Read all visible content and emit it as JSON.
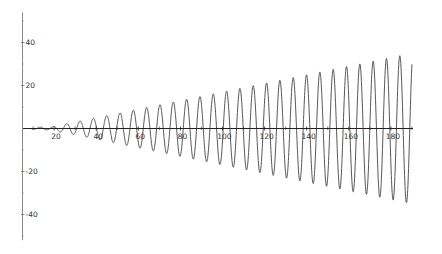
{
  "chart_data": {
    "type": "line",
    "title": "",
    "xlabel": "",
    "ylabel": "",
    "xlim": [
      5,
      190
    ],
    "ylim": [
      -52,
      54
    ],
    "grid": false,
    "legend": null,
    "x_ticks": [
      20,
      40,
      60,
      80,
      100,
      120,
      140,
      160,
      180
    ],
    "x_tick_labels": [
      "20",
      "40",
      "60",
      "80",
      "100",
      "120",
      "140",
      "160",
      "180"
    ],
    "x_minor_ticks": [
      10,
      30,
      50,
      70,
      90,
      110,
      130,
      150,
      170,
      190
    ],
    "y_ticks": [
      40,
      20,
      -20,
      -40
    ],
    "y_tick_labels": [
      "40",
      "20",
      "-20",
      "-40"
    ],
    "y_minor_ticks": [
      50,
      30,
      10,
      -10,
      -30,
      -50
    ],
    "series": [
      {
        "name": "oscillation with linearly growing amplitude",
        "description": "y = A(t) * sin(2*pi*(t - t0)/period), amplitude grows roughly linearly",
        "period": 6.33,
        "phase_t0": 5.4,
        "amplitude_model": "A(t) = 0.2 * (t - 15), ~0 near t<15",
        "x_start": 5,
        "x_end": 190,
        "peaks": [
          {
            "x": 40,
            "y": 3.5
          },
          {
            "x": 52.6,
            "y": 7
          },
          {
            "x": 58.9,
            "y": 8.6
          },
          {
            "x": 65.3,
            "y": 10
          },
          {
            "x": 71.6,
            "y": 11.3
          },
          {
            "x": 77.9,
            "y": 12.6
          },
          {
            "x": 84.3,
            "y": 13.8
          },
          {
            "x": 90.6,
            "y": 15
          },
          {
            "x": 96.9,
            "y": 16.3
          },
          {
            "x": 103.3,
            "y": 17.6
          },
          {
            "x": 109.6,
            "y": 19
          },
          {
            "x": 115.9,
            "y": 20.2
          },
          {
            "x": 122.3,
            "y": 21.4
          },
          {
            "x": 128.6,
            "y": 22.7
          },
          {
            "x": 134.9,
            "y": 24
          },
          {
            "x": 141.3,
            "y": 25.2
          },
          {
            "x": 147.6,
            "y": 26.5
          },
          {
            "x": 153.9,
            "y": 27.8
          },
          {
            "x": 160.3,
            "y": 29
          },
          {
            "x": 166.6,
            "y": 30.3
          },
          {
            "x": 172.9,
            "y": 31.6
          },
          {
            "x": 179.3,
            "y": 32.9
          },
          {
            "x": 183.8,
            "y": 34.1
          },
          {
            "x": 189.5,
            "y": 35.9
          }
        ],
        "troughs": [
          {
            "x": 175.5,
            "y": -31.5
          },
          {
            "x": 181.8,
            "y": -33
          },
          {
            "x": 188.2,
            "y": -36.3
          }
        ],
        "end_value": {
          "x": 190,
          "y": 18
        }
      }
    ]
  },
  "style": {
    "axis_color": "#222222",
    "line_color": "#444444",
    "background": "#ffffff"
  }
}
